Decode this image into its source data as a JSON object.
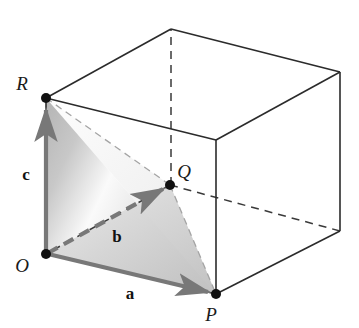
{
  "figure": {
    "background_color": "#ffffff",
    "width": 359,
    "height": 328
  },
  "points": [
    {
      "id": "O",
      "label": "O",
      "x": 46,
      "y": 254,
      "label_x": 22,
      "label_y": 272,
      "dot": true,
      "role": "origin-vertex"
    },
    {
      "id": "P",
      "label": "P",
      "x": 216,
      "y": 294,
      "label_x": 208,
      "label_y": 320,
      "dot": true,
      "role": "vertex-a-tip"
    },
    {
      "id": "Q",
      "label": "Q",
      "x": 170,
      "y": 185,
      "label_x": 178,
      "label_y": 178,
      "dot": true,
      "role": "vertex-b-tip"
    },
    {
      "id": "R",
      "label": "R",
      "x": 46,
      "y": 98,
      "label_x": 22,
      "label_y": 90,
      "dot": true,
      "role": "vertex-c-tip"
    }
  ],
  "vectors": [
    {
      "id": "a",
      "label": "a",
      "from": "O",
      "to": "P",
      "style": "solid",
      "color": "#787878",
      "label_x": 130,
      "label_y": 299
    },
    {
      "id": "b",
      "label": "b",
      "from": "O",
      "to": "Q",
      "style": "dashed",
      "color": "#787878",
      "label_x": 117,
      "label_y": 242
    },
    {
      "id": "c",
      "label": "c",
      "from": "O",
      "to": "R",
      "style": "solid",
      "color": "#787878",
      "label_x": 26,
      "label_y": 180
    }
  ],
  "cube": {
    "front_face": "O-R-topright-P",
    "vertices": {
      "front_bottom_left": {
        "x": 46,
        "y": 254
      },
      "front_top_left": {
        "x": 46,
        "y": 98
      },
      "front_top_right": {
        "x": 216,
        "y": 140
      },
      "front_bottom_right": {
        "x": 216,
        "y": 294
      },
      "back_top_left": {
        "x": 171,
        "y": 29
      },
      "back_top_right": {
        "x": 340,
        "y": 72
      },
      "back_bottom_right": {
        "x": 340,
        "y": 231
      },
      "back_bottom_left": {
        "x": 171,
        "y": 185
      }
    },
    "edge_color": "#2b2b2b",
    "hidden_edge_style": "dashed"
  },
  "shading": {
    "triangle_ORP": {
      "fill_light": "#f4f4f4",
      "fill_dark": "#b9b9b9"
    },
    "triangle_OQP": {
      "fill_light": "#e2e2e2",
      "fill_dark": "#c8c8c8"
    }
  },
  "colors": {
    "ink": "#2b2b2b",
    "vector_gray": "#787878",
    "dot_black": "#111111",
    "hidden_line_gray": "#9a9a9a"
  }
}
